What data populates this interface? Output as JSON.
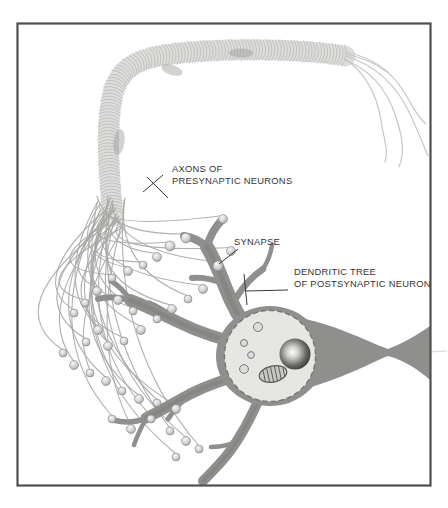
{
  "figure": {
    "annotations": {
      "axons_line1": "AXONS OF",
      "axons_line2": "PRESYNAPTIC NEURONS",
      "synapse": "SYNAPSE",
      "dendritic_line1": "DENDRITIC TREE",
      "dendritic_line2": "OF POSTSYNAPTIC NEURON"
    },
    "colors": {
      "background": "#ffffff",
      "frame": "#4f4f4f",
      "neuron_body": "#8f8f8d",
      "neuron_shadow": "#6e6e6c",
      "nucleus": "#e6e6e4",
      "fiber": "#a7a7a5",
      "bundle": "#dddddb",
      "bundle_texture": "#b2b2b0",
      "loose_fiber": "#c6c6c4",
      "bouton_stroke": "#87878a",
      "label_text": "#333333"
    }
  }
}
